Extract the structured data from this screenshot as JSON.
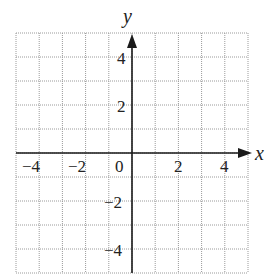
{
  "chart_data": {
    "type": "scatter",
    "title": "",
    "xlabel": "x",
    "ylabel": "y",
    "xlim": [
      -5,
      5
    ],
    "ylim": [
      -5,
      5
    ],
    "grid": true,
    "grid_step": 1,
    "x_ticks": [
      -4,
      -2,
      0,
      2,
      4
    ],
    "y_ticks": [
      -4,
      -2,
      2,
      4
    ],
    "x_tick_labels": [
      "−4",
      "−2",
      "0",
      "2",
      "4"
    ],
    "y_tick_labels": [
      "−4",
      "−2",
      "2",
      "4"
    ],
    "series": [],
    "legend": null
  },
  "labels": {
    "x_axis": "x",
    "y_axis": "y",
    "x_neg4": "−4",
    "x_neg2": "−2",
    "origin": "0",
    "x_pos2": "2",
    "x_pos4": "4",
    "y_pos4": "4",
    "y_pos2": "2",
    "y_neg2": "−2",
    "y_neg4": "−4"
  },
  "colors": {
    "grid": "#9a9a9a",
    "axis": "#1a1a1a",
    "background": "#ffffff"
  }
}
